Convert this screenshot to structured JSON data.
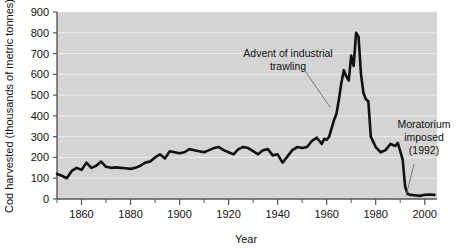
{
  "chart_data": {
    "type": "line",
    "title": "",
    "xlabel": "Year",
    "ylabel": "Cod harvested (thousands of metric tonnes)",
    "xlim": [
      1850,
      2005
    ],
    "ylim": [
      0,
      900
    ],
    "ytick_step": 100,
    "xtick_step": 20,
    "xminor_step": 10,
    "grid": true,
    "legend": "none",
    "xticks": [
      1860,
      1880,
      1900,
      1920,
      1940,
      1960,
      1980,
      2000
    ],
    "yticks": [
      0,
      100,
      200,
      300,
      400,
      500,
      600,
      700,
      800,
      900
    ],
    "series": [
      {
        "name": "Cod harvested",
        "color": "#111111",
        "x": [
          1850,
          1852,
          1854,
          1856,
          1858,
          1860,
          1862,
          1864,
          1866,
          1868,
          1870,
          1872,
          1874,
          1876,
          1878,
          1880,
          1882,
          1884,
          1886,
          1888,
          1890,
          1892,
          1894,
          1896,
          1898,
          1900,
          1902,
          1904,
          1906,
          1908,
          1910,
          1912,
          1914,
          1916,
          1918,
          1920,
          1922,
          1924,
          1926,
          1928,
          1930,
          1932,
          1934,
          1936,
          1938,
          1940,
          1942,
          1944,
          1946,
          1948,
          1950,
          1952,
          1954,
          1956,
          1958,
          1959,
          1960,
          1961,
          1962,
          1963,
          1964,
          1965,
          1966,
          1967,
          1968,
          1969,
          1970,
          1971,
          1972,
          1973,
          1974,
          1975,
          1976,
          1977,
          1978,
          1980,
          1982,
          1984,
          1986,
          1988,
          1989,
          1990,
          1991,
          1992,
          1993,
          1994,
          1996,
          1998,
          2000,
          2002,
          2004
        ],
        "values": [
          120,
          112,
          100,
          135,
          150,
          140,
          175,
          150,
          160,
          180,
          155,
          150,
          152,
          150,
          148,
          145,
          150,
          160,
          175,
          180,
          200,
          215,
          195,
          230,
          225,
          220,
          225,
          240,
          235,
          230,
          225,
          235,
          245,
          250,
          235,
          225,
          215,
          240,
          250,
          245,
          230,
          215,
          235,
          240,
          210,
          215,
          175,
          205,
          235,
          250,
          245,
          250,
          280,
          295,
          265,
          290,
          285,
          300,
          340,
          380,
          410,
          480,
          560,
          620,
          590,
          570,
          690,
          640,
          800,
          780,
          600,
          510,
          480,
          470,
          300,
          250,
          225,
          235,
          265,
          255,
          270,
          230,
          190,
          60,
          25,
          20,
          18,
          15,
          20,
          22,
          20
        ]
      }
    ],
    "annotations": [
      {
        "id": "advent-of-industrial-trawling",
        "line1": "Advent of industrial",
        "line2": "trawling",
        "text_x": 288,
        "text_y": 57,
        "leader": {
          "x1": 303,
          "y1": 68,
          "x2": 330,
          "y2": 107
        }
      },
      {
        "id": "moratorium-imposed",
        "line1": "Moratorium",
        "line2": "imposed",
        "line3": "(1992)",
        "text_x": 424,
        "text_y": 128,
        "leader": {
          "x1": 414,
          "y1": 164,
          "x2": 406,
          "y2": 196
        }
      }
    ]
  },
  "colors": {
    "plot_background": "#d4d4d4",
    "gridline": "#ececec",
    "axis": "#55575a",
    "line": "#111111",
    "text": "#111111",
    "page_background": "#ffffff"
  }
}
